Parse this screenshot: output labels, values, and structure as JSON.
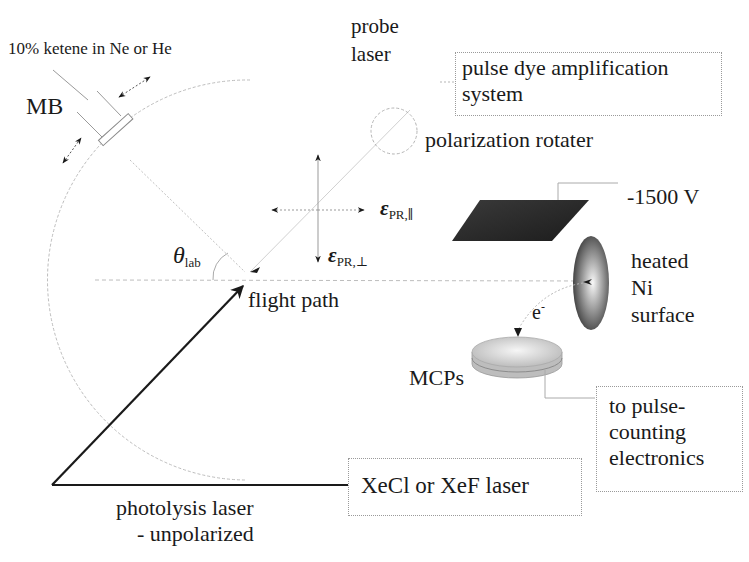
{
  "diagram": {
    "type": "experimental-apparatus-schematic",
    "labels": {
      "gas_mixture": "10% ketene in Ne or He",
      "molecular_beam": "MB",
      "probe_laser_line1": "probe",
      "probe_laser_line2": "laser",
      "pdas_line1": "pulse dye amplification",
      "pdas_line2": "system",
      "polarization_rotater": "polarization rotater",
      "voltage": "-1500 V",
      "eps_symbol": "ε",
      "eps_parallel_sub": "PR,∥",
      "eps_perp_sub": "PR,⊥",
      "theta_symbol": "θ",
      "theta_sub": "lab",
      "flight_path": "flight path",
      "electron": "e",
      "electron_sup": "-",
      "ni_line1": "heated",
      "ni_line2": "Ni",
      "ni_line3": "surface",
      "mcps": "MCPs",
      "electronics_line1": "to pulse-",
      "electronics_line2": "counting",
      "electronics_line3": "electronics",
      "excimer_laser": "XeCl or XeF laser",
      "photolysis_line1": "photolysis laser",
      "photolysis_line2": "- unpolarized"
    },
    "colors": {
      "ink": "#1a1a1a",
      "dotted_lines": "#b0b0b0",
      "plate": "#262626",
      "ni_surface_center": "#f4f4f4",
      "ni_surface_edge": "#3a3a3a",
      "mcp_face": "#e6e6e6",
      "mcp_edge": "#a8a8a8"
    }
  }
}
